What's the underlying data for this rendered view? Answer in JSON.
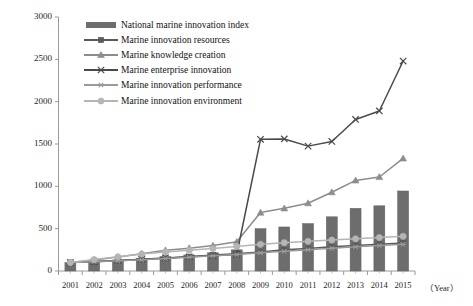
{
  "chart_data": {
    "type": "bar",
    "title": "",
    "xlabel": "（Year）",
    "ylabel": "",
    "categories": [
      "2001",
      "2002",
      "2003",
      "2004",
      "2005",
      "2006",
      "2007",
      "2008",
      "2009",
      "2010",
      "2011",
      "2012",
      "2013",
      "2014",
      "2015"
    ],
    "ylim": [
      0,
      3000
    ],
    "yticks": [
      0,
      500,
      1000,
      1500,
      2000,
      2500,
      3000
    ],
    "grid": false,
    "legend_position": "top-left",
    "series": [
      {
        "name": "National marine innovation index",
        "type": "bar",
        "marker": "bar",
        "color": "#6d6d6d",
        "values": [
          100,
          112,
          130,
          150,
          170,
          190,
          215,
          250,
          500,
          520,
          560,
          640,
          740,
          770,
          945
        ]
      },
      {
        "name": "Marine innovation resources",
        "type": "line",
        "marker": "square",
        "color": "#5a5a5a",
        "values": [
          100,
          108,
          120,
          135,
          150,
          168,
          190,
          205,
          225,
          250,
          265,
          285,
          300,
          315,
          330
        ]
      },
      {
        "name": "Marine knowledge creation",
        "type": "line",
        "marker": "triangle",
        "color": "#8c8c8c",
        "values": [
          100,
          130,
          165,
          205,
          245,
          270,
          300,
          345,
          690,
          740,
          800,
          930,
          1070,
          1110,
          1330
        ]
      },
      {
        "name": "Marine enterprise innovation",
        "type": "line",
        "marker": "x",
        "color": "#4a4a4a",
        "values": [
          100,
          112,
          125,
          140,
          155,
          168,
          180,
          195,
          1555,
          1560,
          1475,
          1530,
          1790,
          1890,
          2480
        ]
      },
      {
        "name": "Marine innovation performance",
        "type": "line",
        "marker": "asterisk",
        "color": "#9a9a9a",
        "values": [
          100,
          110,
          120,
          132,
          148,
          162,
          180,
          195,
          215,
          232,
          250,
          268,
          285,
          300,
          315
        ]
      },
      {
        "name": "Marine innovation environment",
        "type": "line",
        "marker": "circle",
        "color": "#b5b5b5",
        "values": [
          100,
          135,
          168,
          200,
          225,
          245,
          265,
          290,
          315,
          335,
          350,
          365,
          380,
          395,
          410
        ]
      }
    ]
  },
  "axis": {
    "y_labels": [
      "3000",
      "2500",
      "2000",
      "1500",
      "1000",
      "500",
      "0"
    ],
    "x_labels": [
      "2001",
      "2002",
      "2003",
      "2004",
      "2005",
      "2006",
      "2007",
      "2008",
      "2009",
      "2010",
      "2011",
      "2012",
      "2013",
      "2014",
      "2015"
    ],
    "x_title": "（Year）"
  },
  "legend": {
    "items": [
      {
        "label": "National marine innovation index"
      },
      {
        "label": "Marine innovation resources"
      },
      {
        "label": "Marine knowledge creation"
      },
      {
        "label": "Marine enterprise innovation"
      },
      {
        "label": "Marine innovation performance"
      },
      {
        "label": "Marine innovation environment"
      }
    ]
  }
}
